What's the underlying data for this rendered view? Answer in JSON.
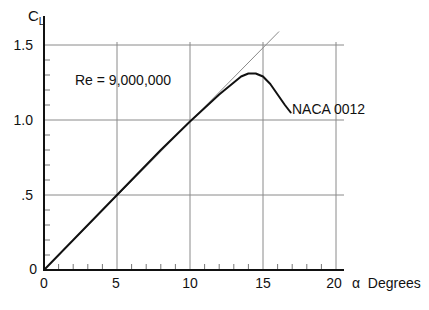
{
  "chart_data": {
    "type": "line",
    "title": "",
    "xlabel": "α  Degrees",
    "ylabel": "CL",
    "ylabel_main": "C",
    "ylabel_sub": "L",
    "xlim": [
      0,
      20
    ],
    "ylim": [
      0,
      1.5
    ],
    "x_ticks": [
      "0",
      "5",
      "10",
      "15",
      "20"
    ],
    "y_ticks": [
      "0",
      ".5",
      "1.0",
      "1.5"
    ],
    "grid": true,
    "annotations": [
      {
        "text": "Re = 9,000,000",
        "x": 3.3,
        "y": 1.3
      },
      {
        "text": "NACA 0012",
        "x": 17.0,
        "y": 1.05
      }
    ],
    "series": [
      {
        "name": "NACA 0012",
        "x": [
          0,
          2,
          4,
          6,
          8,
          10,
          11,
          12,
          13,
          13.5,
          14,
          14.5,
          15,
          15.5,
          16,
          16.5,
          16.9
        ],
        "values": [
          0,
          0.2,
          0.4,
          0.6,
          0.8,
          0.99,
          1.08,
          1.17,
          1.25,
          1.29,
          1.31,
          1.31,
          1.29,
          1.24,
          1.17,
          1.1,
          1.05
        ]
      },
      {
        "name": "Linear lift slope (reference)",
        "x": [
          0,
          16.1
        ],
        "values": [
          0,
          1.59
        ]
      }
    ]
  }
}
